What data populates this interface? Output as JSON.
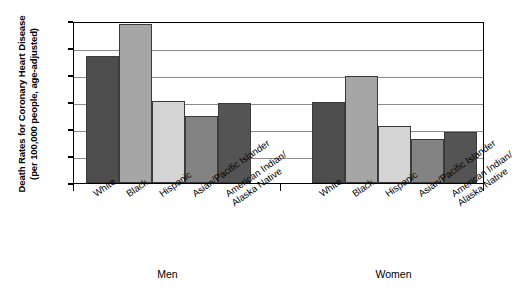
{
  "chart_data": {
    "type": "bar",
    "title": "",
    "subtitle": "",
    "ylabel_line1": "Death Rates for Coronary Heart Disease",
    "ylabel_line2": "(per 100,000 people, age-adjusted)",
    "xlabel": "",
    "ylim": [
      0,
      300
    ],
    "yticks": [
      0,
      50,
      100,
      150,
      200,
      250,
      300
    ],
    "ytick_labels": [
      "0",
      "50",
      "100",
      "150",
      "200",
      "250",
      "300"
    ],
    "grid": true,
    "legend": "none",
    "categories": [
      "White",
      "Black",
      "Hispanic",
      "Asian/Pacific Islander",
      "American Indian/ Alaska Native"
    ],
    "category_lines": [
      [
        "White"
      ],
      [
        "Black"
      ],
      [
        "Hispanic"
      ],
      [
        "Asian/Pacific Islander"
      ],
      [
        "American Indian/",
        "Alaska Native"
      ]
    ],
    "groups": [
      "Men",
      "Women"
    ],
    "series": [
      {
        "name": "Men",
        "values": [
          235,
          295,
          152,
          125,
          148
        ]
      },
      {
        "name": "Women",
        "values": [
          150,
          198,
          105,
          82,
          95
        ]
      }
    ],
    "bar_colors": [
      "#4d4d4d",
      "#a6a6a6",
      "#d4d4d4",
      "#838383",
      "#545454"
    ]
  }
}
